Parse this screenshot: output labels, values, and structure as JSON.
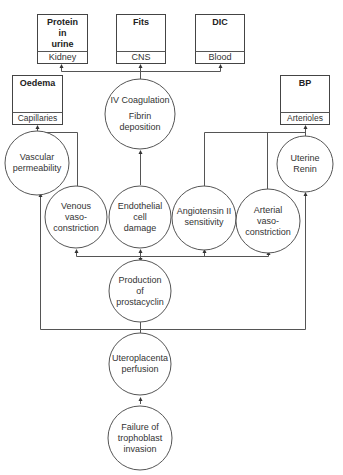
{
  "diagram": {
    "outcomes": [
      {
        "id": "protein",
        "title": "Protein in urine",
        "title_lines": [
          "Protein",
          "in",
          "urine"
        ],
        "organ": "Kidney"
      },
      {
        "id": "fits",
        "title": "Fits",
        "title_lines": [
          "Fits"
        ],
        "organ": "CNS"
      },
      {
        "id": "dic",
        "title": "DIC",
        "title_lines": [
          "DIC"
        ],
        "organ": "Blood"
      },
      {
        "id": "oedema",
        "title": "Oedema",
        "title_lines": [
          "Oedema"
        ],
        "organ": "Capillaries"
      },
      {
        "id": "bp",
        "title": "BP",
        "title_lines": [
          "BP"
        ],
        "organ": "Arterioles"
      }
    ],
    "processes": [
      {
        "id": "coagulation",
        "lines": [
          "IV Coagulation",
          "Fibrin",
          "deposition"
        ]
      },
      {
        "id": "vascular",
        "lines": [
          "Vascular",
          "permeability"
        ]
      },
      {
        "id": "uterine",
        "lines": [
          "Uterine",
          "Renin"
        ]
      },
      {
        "id": "venous",
        "lines": [
          "Venous",
          "vaso-",
          "constriction"
        ]
      },
      {
        "id": "endothelial",
        "lines": [
          "Endothelial",
          "cell",
          "damage"
        ]
      },
      {
        "id": "angiotensin",
        "lines": [
          "Angiotensin II",
          "sensitivity"
        ]
      },
      {
        "id": "arterial",
        "lines": [
          "Arterial",
          "vaso-",
          "constriction"
        ]
      },
      {
        "id": "prostacyclin",
        "lines": [
          "Production",
          "of",
          "prostacyclin"
        ]
      },
      {
        "id": "uteroplacenta",
        "lines": [
          "Uteroplacenta",
          "perfusion"
        ]
      },
      {
        "id": "failure",
        "lines": [
          "Failure of",
          "trophoblast",
          "invasion"
        ]
      }
    ]
  }
}
